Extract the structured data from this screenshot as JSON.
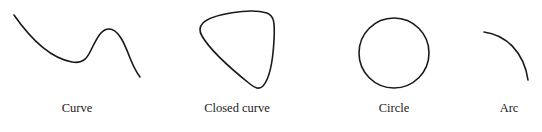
{
  "figure": {
    "stroke_color": "#1a1a1a",
    "items": [
      {
        "id": "curve",
        "label": "Curve"
      },
      {
        "id": "closed-curve",
        "label": "Closed curve"
      },
      {
        "id": "circle",
        "label": "Circle"
      },
      {
        "id": "arc",
        "label": "Arc"
      }
    ]
  }
}
